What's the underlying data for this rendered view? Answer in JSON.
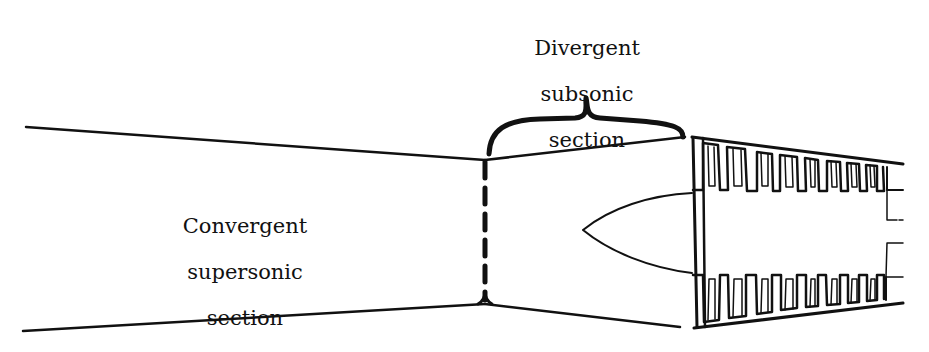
{
  "diagram": {
    "type": "ramjet-inlet-cross-section",
    "labels": {
      "convergent": {
        "line1": "Convergent",
        "line2": "supersonic",
        "line3": "section"
      },
      "divergent": {
        "line1": "Divergent",
        "line2": "subsonic",
        "line3": "section"
      }
    },
    "colors": {
      "ink": "#111111",
      "background": "#ffffff"
    }
  }
}
